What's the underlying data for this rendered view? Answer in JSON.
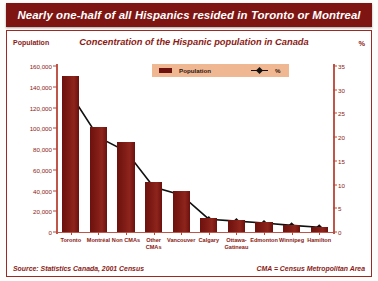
{
  "banner": {
    "title": "Nearly one-half of all Hispanics resided in Toronto or Montreal"
  },
  "header": {
    "left_axis_title": "Population",
    "chart_subtitle": "Concentration of the Hispanic population in Canada",
    "right_axis_title": "%"
  },
  "legend": {
    "series_bar": "Population",
    "series_line": "%"
  },
  "footer": {
    "source": "Source: Statistics Canada, 2001 Census",
    "note": "CMA = Census Metropolitan Area"
  },
  "colors": {
    "banner_bg": "#7e1512",
    "bar_fill": "#7a1712",
    "axis": "#b5483c",
    "text_red": "#8b1a14",
    "legend_bg": "#efb792",
    "line": "#111111"
  },
  "chart_data": {
    "type": "bar",
    "title": "Concentration of the Hispanic population in Canada",
    "xlabel": "",
    "ylabel": "Population",
    "y2label": "%",
    "ylim": [
      0,
      160000
    ],
    "y2lim": [
      0,
      35
    ],
    "yticks": [
      "0",
      "20,000",
      "40,000",
      "60,000",
      "80,000",
      "100,000",
      "120,000",
      "140,000",
      "160,000"
    ],
    "ytick_values": [
      0,
      20000,
      40000,
      60000,
      80000,
      100000,
      120000,
      140000,
      160000
    ],
    "y2ticks": [
      "0",
      "5",
      "10",
      "15",
      "20",
      "25",
      "30",
      "35"
    ],
    "y2tick_values": [
      0,
      5,
      10,
      15,
      20,
      25,
      30,
      35
    ],
    "grid": false,
    "legend_position": "top-center",
    "categories": [
      "Toronto",
      "Montréal",
      "Non CMAs",
      "Other\nCMAs",
      "Vancouver",
      "Calgary",
      "Ottawa-\nGatineau",
      "Edmonton",
      "Winnipeg",
      "Hamilton"
    ],
    "series": [
      {
        "name": "Population",
        "type": "bar",
        "axis": "left",
        "values": [
          150000,
          101000,
          87000,
          48000,
          40000,
          13500,
          11500,
          9500,
          7000,
          5000
        ]
      },
      {
        "name": "%",
        "type": "line",
        "axis": "right",
        "values": [
          29.0,
          20.0,
          17.0,
          9.5,
          7.8,
          2.7,
          2.3,
          1.9,
          1.4,
          1.0
        ]
      }
    ]
  }
}
